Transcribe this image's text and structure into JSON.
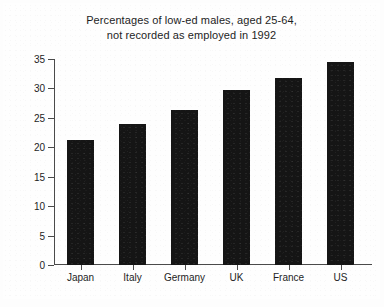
{
  "chart_data": {
    "type": "bar",
    "title": "Percentages of low-ed males, aged 25-64, not recorded as employed in 1992",
    "title_lines": [
      "Percentages of low-ed males, aged 25-64,",
      "not recorded as employed in 1992"
    ],
    "categories": [
      "Japan",
      "Italy",
      "Germany",
      "UK",
      "France",
      "US"
    ],
    "values": [
      21.2,
      24.0,
      26.4,
      29.8,
      31.7,
      34.5
    ],
    "xlabel": "",
    "ylabel": "",
    "ylim": [
      0,
      35
    ],
    "yticks": [
      0,
      5,
      10,
      15,
      20,
      25,
      30,
      35
    ],
    "ytick_labels": [
      "0",
      "5",
      "10",
      "15",
      "20",
      "25",
      "30",
      "35"
    ],
    "grid": false,
    "legend": null,
    "bar_color": "#151515",
    "axis_color": "#4a4a4a",
    "background_color": "#fefefe",
    "frame_color": "#3a3a3a"
  }
}
